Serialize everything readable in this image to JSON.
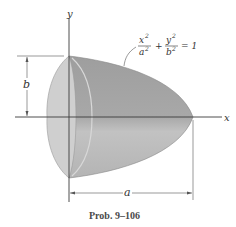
{
  "figure": {
    "caption": "Prob. 9–106",
    "axes": {
      "x_label": "x",
      "y_label": "y"
    },
    "equation": {
      "num1": "x",
      "den1": "a",
      "exp": "2",
      "plus": "+",
      "num2": "y",
      "den2": "b",
      "equals": "= 1"
    },
    "dimensions": {
      "height_label": "b",
      "length_label": "a"
    },
    "colors": {
      "body_dark": "#a6a6a6",
      "body_light": "#c4c4c4",
      "end_face": "#d0d0d0",
      "axis": "#3a3a3a",
      "dimension": "#555555"
    }
  }
}
